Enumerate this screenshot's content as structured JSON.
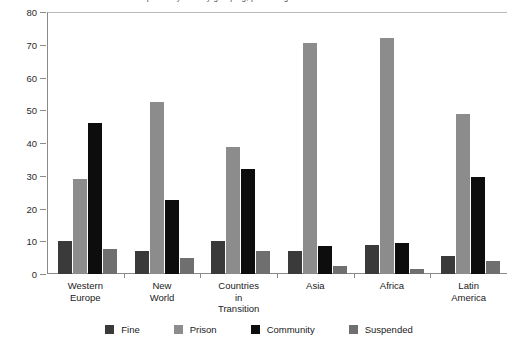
{
  "chart_data": {
    "type": "bar",
    "title": "Sentences imposed by country grouping, percentages",
    "xlabel": "",
    "ylabel": "",
    "ylim": [
      0,
      80
    ],
    "ytick_step": 10,
    "yticks": [
      0,
      10,
      20,
      30,
      40,
      50,
      60,
      70,
      80
    ],
    "grid": false,
    "legend_position": "bottom",
    "categories": [
      "Western\nEurope",
      "New\nWorld",
      "Countries\nin\nTransition",
      "Asia",
      "Africa",
      "Latin\nAmerica"
    ],
    "series": [
      {
        "name": "Fine",
        "color": "#3a3a3a",
        "values": [
          10,
          7,
          10,
          7,
          9,
          5.5
        ]
      },
      {
        "name": "Prison",
        "color": "#8c8c8c",
        "values": [
          29,
          52.5,
          38.8,
          70.5,
          72,
          49
        ]
      },
      {
        "name": "Community",
        "color": "#0d0d0d",
        "values": [
          46,
          22.5,
          32,
          8.5,
          9.5,
          29.5
        ]
      },
      {
        "name": "Suspended",
        "color": "#6f6f6f",
        "values": [
          7.5,
          5,
          7,
          2.5,
          1.5,
          4
        ]
      }
    ]
  },
  "axis": {
    "tick_labels": [
      "0",
      "10",
      "20",
      "30",
      "40",
      "50",
      "60",
      "70",
      "80"
    ]
  },
  "category_labels": [
    [
      "Western",
      "Europe"
    ],
    [
      "New",
      "World"
    ],
    [
      "Countries",
      "in",
      "Transition"
    ],
    [
      "Asia"
    ],
    [
      "Africa"
    ],
    [
      "Latin",
      "America"
    ]
  ],
  "legend_items": [
    {
      "label": "Fine",
      "color": "#3a3a3a"
    },
    {
      "label": "Prison",
      "color": "#8c8c8c"
    },
    {
      "label": "Community",
      "color": "#0d0d0d"
    },
    {
      "label": "Suspended",
      "color": "#6f6f6f"
    }
  ],
  "colors": {
    "axis": "#8a8a8a",
    "top_rule": "#b9b9b9",
    "text": "#1a1a1a",
    "background": "#ffffff"
  }
}
